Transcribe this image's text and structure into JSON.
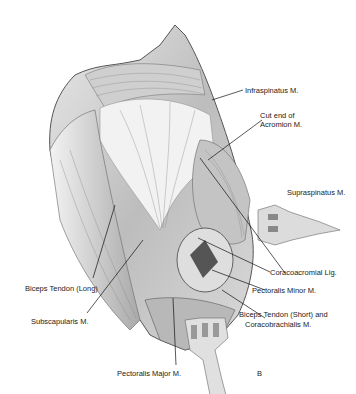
{
  "figure": {
    "panel_letter": "B",
    "labels": {
      "infraspinatus": "Infraspinatus M.",
      "cut_end_1": "Cut end of",
      "cut_end_2": "Acromion M.",
      "supraspinatus": "Supraspinatus M.",
      "coracoacromial": "Coracoacromial Lig.",
      "pectoralis_minor": "Pectoralis Minor M.",
      "biceps_short_1": "Biceps Tendon (Short) and",
      "biceps_short_2": "Coracobrachialis M.",
      "biceps_long": "Biceps Tendon (Long)",
      "subscapularis": "Subscapularis M.",
      "pectoralis_major": "Pectoralis Major M."
    }
  }
}
